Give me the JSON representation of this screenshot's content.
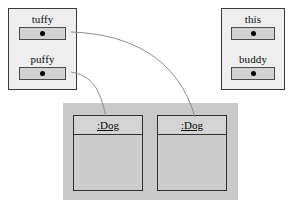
{
  "diagram": {
    "type": "uml-object-diagram"
  },
  "frames": [
    {
      "id": "frame-left",
      "name": "left-stack-frame",
      "slots": [
        {
          "label": "tuffy",
          "value_icon": "reference-dot"
        },
        {
          "label": "puffy",
          "value_icon": "reference-dot"
        }
      ]
    },
    {
      "id": "frame-right",
      "name": "right-stack-frame",
      "slots": [
        {
          "label": "this",
          "value_icon": "reference-dot"
        },
        {
          "label": "buddy",
          "value_icon": "reference-dot"
        }
      ]
    }
  ],
  "heap": {
    "name": "heap-panel",
    "objects": [
      {
        "id": "obj-left",
        "name": ":Dog",
        "attributes": []
      },
      {
        "id": "obj-right",
        "name": ":Dog",
        "attributes": []
      }
    ]
  },
  "links": [
    {
      "from": "tuffy",
      "to": "obj-right"
    },
    {
      "from": "puffy",
      "to": "obj-left"
    }
  ],
  "colors": {
    "frame_fill": "#eeeeee",
    "frame_border": "#3a3a3a",
    "slot_fill": "#d2d2d2",
    "heap_fill": "#c9c9c9",
    "object_fill": "#d0d0d0",
    "link_stroke": "#8d8d8d"
  }
}
